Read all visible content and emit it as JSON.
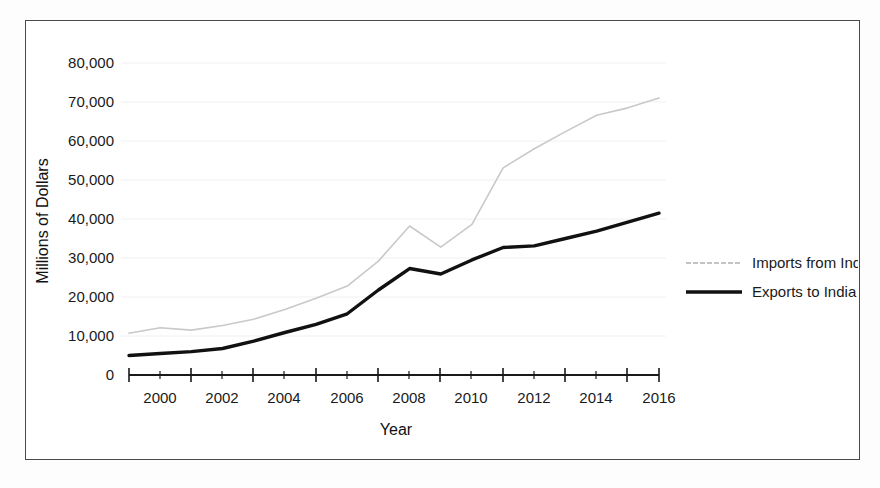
{
  "chart_data": {
    "type": "line",
    "title": "",
    "xlabel": "Year",
    "ylabel": "Millions of Dollars",
    "x": [
      1999,
      2000,
      2001,
      2002,
      2003,
      2004,
      2005,
      2006,
      2007,
      2008,
      2009,
      2010,
      2011,
      2012,
      2013,
      2014,
      2015,
      2016
    ],
    "xlim": [
      1999,
      2016
    ],
    "ylim": [
      0,
      80000
    ],
    "xtick_labels": [
      "2000",
      "2002",
      "2004",
      "2006",
      "2008",
      "2010",
      "2012",
      "2014",
      "2016"
    ],
    "xtick_values": [
      2000,
      2002,
      2004,
      2006,
      2008,
      2010,
      2012,
      2014,
      2016
    ],
    "ytick_labels": [
      "0",
      "10,000",
      "20,000",
      "30,000",
      "40,000",
      "50,000",
      "60,000",
      "70,000",
      "80,000"
    ],
    "ytick_values": [
      0,
      10000,
      20000,
      30000,
      40000,
      50000,
      60000,
      70000,
      80000
    ],
    "grid": false,
    "legend_position": "right",
    "series": [
      {
        "name": "Imports from India",
        "color": "#c9c9c9",
        "line_width": 1.6,
        "values": [
          10700,
          12100,
          11500,
          12700,
          14300,
          16800,
          19700,
          22800,
          29200,
          38200,
          32800,
          38600,
          53100,
          58000,
          62400,
          66600,
          68500,
          71000
        ]
      },
      {
        "name": "Exports to India",
        "color": "#111111",
        "line_width": 3.4,
        "values": [
          5000,
          5500,
          6000,
          6800,
          8700,
          10900,
          13000,
          15700,
          21800,
          27300,
          25900,
          29500,
          32700,
          33100,
          35000,
          36900,
          39200,
          41500
        ]
      }
    ]
  },
  "axes": {
    "y_axis_title": "Millions of Dollars",
    "x_axis_title": "Year"
  },
  "legend": {
    "items": [
      {
        "label": "Imports from India",
        "swatch": "dotted-light-line"
      },
      {
        "label": "Exports to India",
        "swatch": "solid-black-line"
      }
    ]
  }
}
